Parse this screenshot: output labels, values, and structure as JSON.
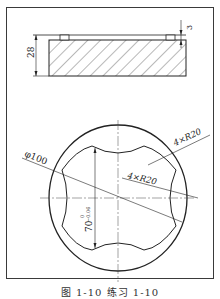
{
  "drawing": {
    "side_view": {
      "height_label": "28",
      "groove_depth_label": "3"
    },
    "top_view": {
      "diameter_label": "φ100",
      "outer_radius_label": "4×R20",
      "inner_radius_label": "4×R20",
      "width_label": "70",
      "tolerance_upper": "0",
      "tolerance_lower": "−0.06"
    }
  },
  "caption": "图 1-10   练习 1-10"
}
